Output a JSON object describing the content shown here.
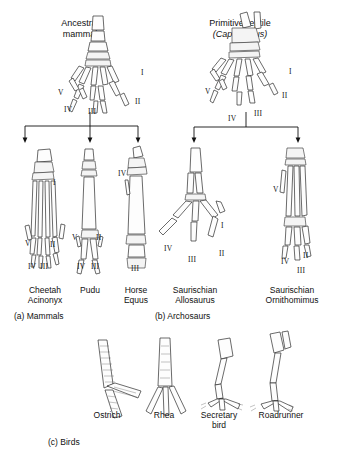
{
  "figure": {
    "ancestors": [
      {
        "id": "ancestral-mammal",
        "name_line1": "Ancestral",
        "name_line2": "mammal",
        "digits": [
          "I",
          "II",
          "III",
          "IV",
          "V"
        ]
      },
      {
        "id": "primitive-reptile",
        "name_line1": "Primitive reptile",
        "name_line2": "(Captorhinus)",
        "italic_line2": true,
        "digits": [
          "I",
          "II",
          "III",
          "IV",
          "V"
        ]
      }
    ],
    "specimens": [
      {
        "id": "cheetah",
        "common": "Cheetah",
        "genus": "Acinonyx",
        "group": "a",
        "digits": [
          "I",
          "II",
          "III",
          "IV",
          "V"
        ]
      },
      {
        "id": "pudu",
        "common": "Pudu",
        "genus": "",
        "group": "a",
        "digits": [
          "II",
          "III",
          "IV",
          "V"
        ],
        "common_italic": true
      },
      {
        "id": "horse",
        "common": "Horse",
        "genus": "Equus",
        "group": "a",
        "digits": [
          "III",
          "IV"
        ]
      },
      {
        "id": "allosaurus",
        "common": "Saurischian",
        "genus": "Allosaurus",
        "group": "b",
        "digits": [
          "I",
          "II",
          "III",
          "IV"
        ]
      },
      {
        "id": "ornithomimus",
        "common": "Saurischian",
        "genus": "Ornithomimus",
        "group": "b",
        "digits": [
          "II",
          "III",
          "IV",
          "V"
        ]
      }
    ],
    "sections": [
      {
        "id": "mammals",
        "label": "(a) Mammals"
      },
      {
        "id": "archosaurs",
        "label": "(b) Archosaurs"
      },
      {
        "id": "birds",
        "label": "(c) Birds"
      }
    ],
    "birds": [
      {
        "id": "ostrich",
        "label_line1": "Ostrich",
        "label_line2": ""
      },
      {
        "id": "rhea",
        "label_line1": "Rhea",
        "label_line2": ""
      },
      {
        "id": "secretary-bird",
        "label_line1": "Secretary",
        "label_line2": "bird"
      },
      {
        "id": "roadrunner",
        "label_line1": "Roadrunner",
        "label_line2": ""
      }
    ],
    "colors": {
      "ink": "#1a1a1a",
      "bone_fill": "#fdfdfd",
      "bone_stroke": "#2b2b2b",
      "background": "#ffffff"
    }
  }
}
